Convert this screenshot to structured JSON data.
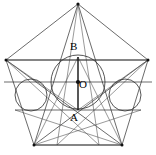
{
  "figure": {
    "canvas": {
      "width": 156,
      "height": 155,
      "background": "#ffffff"
    },
    "colors": {
      "stroke": "#2b2b2b",
      "stroke_soft": "#555555",
      "axis": "#111111",
      "label": "#000000",
      "background": "#ffffff"
    },
    "labels": [
      {
        "name": "label-B",
        "text": "B",
        "x": 72,
        "y": 47
      },
      {
        "name": "label-O",
        "text": "O",
        "x": 79,
        "y": 84
      },
      {
        "name": "label-A",
        "text": "A",
        "x": 72,
        "y": 113
      }
    ],
    "points": {
      "top_vertex": {
        "name": "P1",
        "x": 78,
        "y": 4
      },
      "right_vertex": {
        "name": "P2",
        "x": 148,
        "y": 60
      },
      "bottom_right_vertex": {
        "name": "P3",
        "x": 122,
        "y": 145
      },
      "bottom_left_vertex": {
        "name": "P4",
        "x": 34,
        "y": 145
      },
      "left_vertex": {
        "name": "P5",
        "x": 6,
        "y": 60
      },
      "center_O": {
        "x": 78,
        "y": 82
      },
      "point_B": {
        "x": 78,
        "y": 57
      },
      "point_A": {
        "x": 78,
        "y": 110
      }
    },
    "circles": [
      {
        "name": "main-incircle",
        "cx": 78,
        "cy": 82,
        "r": 27
      },
      {
        "name": "left-small-circle",
        "cx": 31,
        "cy": 95,
        "r": 16
      },
      {
        "name": "right-small-circle",
        "cx": 125,
        "cy": 95,
        "r": 16
      }
    ],
    "horizontal_lines": [
      {
        "name": "upper-horizontal",
        "y": 60,
        "x1": 6,
        "x2": 148
      },
      {
        "name": "mid-horizontal-through-O",
        "y": 82,
        "x1": 4,
        "x2": 152
      },
      {
        "name": "lower-horizontal-through-A",
        "y": 110,
        "x1": 15,
        "x2": 141
      },
      {
        "name": "bottom-horizontal",
        "y": 145,
        "x1": 34,
        "x2": 122
      }
    ],
    "segments": {
      "vertical_axis": {
        "name": "segment-BA",
        "x": 78,
        "y1": 57,
        "y2": 110
      }
    }
  }
}
